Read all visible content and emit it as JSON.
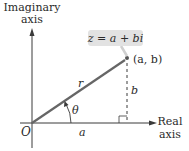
{
  "diagram": {
    "type": "complex-plane-polar-form",
    "axes": {
      "vertical": {
        "label_line1": "Imaginary",
        "label_line2": "axis"
      },
      "horizontal": {
        "label_line1": "Real",
        "label_line2": "axis"
      }
    },
    "origin_label": "O",
    "point_label": "(a, b)",
    "equation_label": "z = a + bi",
    "segments": {
      "radius_label": "r",
      "angle_label": "θ",
      "horizontal_leg_label": "a",
      "vertical_leg_label": "b"
    },
    "colors": {
      "axis": "#3a3a3a",
      "radius": "#666666",
      "label_box": "#e2e2e2",
      "text": "#2a2a2a"
    }
  }
}
